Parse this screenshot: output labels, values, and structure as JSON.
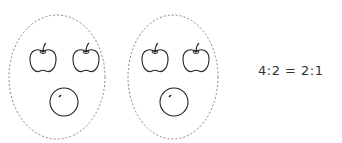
{
  "groups": [
    {
      "label": "group-1",
      "apples": 2,
      "oranges": 1
    },
    {
      "label": "group-2",
      "apples": 2,
      "oranges": 1
    }
  ],
  "equation": "4:2 = 2:1",
  "colors": {
    "stroke": "#222222",
    "dash": "#777777",
    "text": "#333333"
  }
}
